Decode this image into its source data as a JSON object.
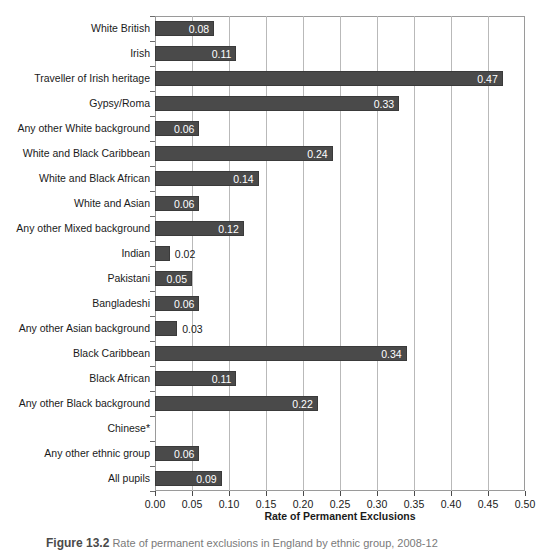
{
  "chart_data": {
    "type": "bar",
    "orientation": "horizontal",
    "title": "",
    "xlabel": "Rate of Permanent Exclusions",
    "ylabel": "",
    "xlim": [
      0.0,
      0.5
    ],
    "xticks": [
      "0.00",
      "0.05",
      "0.10",
      "0.15",
      "0.20",
      "0.25",
      "0.30",
      "0.35",
      "0.40",
      "0.45",
      "0.50"
    ],
    "xtick_values": [
      0.0,
      0.05,
      0.1,
      0.15,
      0.2,
      0.25,
      0.3,
      0.35,
      0.4,
      0.45,
      0.5
    ],
    "grid": "vertical",
    "legend": "none",
    "bar_color": "#4a4a4a",
    "categories": [
      "White British",
      "Irish",
      "Traveller of Irish heritage",
      "Gypsy/Roma",
      "Any other White background",
      "White and Black Caribbean",
      "White and Black African",
      "White and Asian",
      "Any other Mixed background",
      "Indian",
      "Pakistani",
      "Bangladeshi",
      "Any other Asian background",
      "Black Caribbean",
      "Black African",
      "Any other Black background",
      "Chinese*",
      "Any other ethnic group",
      "All pupils"
    ],
    "values": [
      0.08,
      0.11,
      0.47,
      0.33,
      0.06,
      0.24,
      0.14,
      0.06,
      0.12,
      0.02,
      0.05,
      0.06,
      0.03,
      0.34,
      0.11,
      0.22,
      null,
      0.06,
      0.09
    ],
    "labels": [
      "0.08",
      "0.11",
      "0.47",
      "0.33",
      "0.06",
      "0.24",
      "0.14",
      "0.06",
      "0.12",
      "0.02",
      "0.05",
      "0.06",
      "0.03",
      "0.34",
      "0.11",
      "0.22",
      "",
      "0.06",
      "0.09"
    ],
    "label_placement": [
      "inside",
      "inside",
      "inside",
      "inside",
      "inside",
      "inside",
      "inside",
      "inside",
      "inside",
      "outside",
      "inside",
      "inside",
      "outside",
      "inside",
      "inside",
      "inside",
      "none",
      "inside",
      "inside"
    ]
  },
  "caption": {
    "number": "Figure 13.2",
    "text": "Rate of permanent exclusions in England by ethnic group, 2008-12"
  }
}
